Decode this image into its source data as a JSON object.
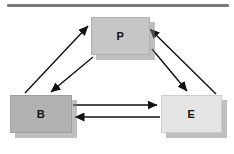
{
  "rule": {
    "color": "#7a7a7a"
  },
  "nodes": {
    "p": {
      "label": "P",
      "fill": "#c6c6c6"
    },
    "b": {
      "label": "B",
      "fill": "#b2b2b2"
    },
    "e": {
      "label": "E",
      "fill": "#e5e5e5"
    }
  },
  "edges": [
    {
      "from": "B",
      "to": "P"
    },
    {
      "from": "P",
      "to": "B"
    },
    {
      "from": "E",
      "to": "P"
    },
    {
      "from": "P",
      "to": "E"
    },
    {
      "from": "B",
      "to": "E"
    },
    {
      "from": "E",
      "to": "B"
    }
  ],
  "colors": {
    "background": "#ffffff",
    "arrow": "#111111",
    "node_shadow": "#ababab"
  }
}
